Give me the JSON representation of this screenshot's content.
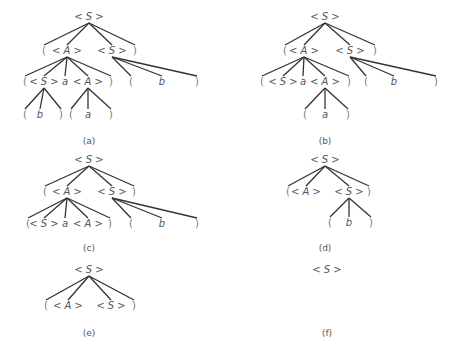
{
  "figure": {
    "type": "parse-tree-sequence",
    "colors": {
      "edge": "#333333",
      "text": "#555555",
      "background": "#ffffff"
    },
    "trees": [
      {
        "label": "(a)",
        "nodes": [
          {
            "id": "r",
            "text": "<S>",
            "x": 89,
            "y": 20
          },
          {
            "id": "l1",
            "text": "(",
            "x": 44,
            "y": 54,
            "parent": "r"
          },
          {
            "id": "A1",
            "text": "<A>",
            "x": 67,
            "y": 54,
            "parent": "r"
          },
          {
            "id": "S1",
            "text": "<S>",
            "x": 112,
            "y": 54,
            "parent": "r"
          },
          {
            "id": "r1",
            "text": ")",
            "x": 135,
            "y": 54,
            "parent": "r"
          },
          {
            "id": "l2",
            "text": "(",
            "x": 25,
            "y": 85,
            "parent": "A1"
          },
          {
            "id": "S2",
            "text": "<S>",
            "x": 44,
            "y": 85,
            "parent": "A1"
          },
          {
            "id": "a2",
            "text": "a",
            "x": 65,
            "y": 85,
            "parent": "A1"
          },
          {
            "id": "A2",
            "text": "<A>",
            "x": 88,
            "y": 85,
            "parent": "A1"
          },
          {
            "id": "r2",
            "text": ")",
            "x": 111,
            "y": 85,
            "parent": "A1"
          },
          {
            "id": "l3",
            "text": "(",
            "x": 131,
            "y": 85,
            "parent": "S1"
          },
          {
            "id": "b3",
            "text": "b",
            "x": 162,
            "y": 85,
            "parent": "S1"
          },
          {
            "id": "r3",
            "text": ")",
            "x": 197,
            "y": 85,
            "parent": "S1"
          },
          {
            "id": "l4",
            "text": "(",
            "x": 25,
            "y": 118,
            "parent": "S2"
          },
          {
            "id": "b4",
            "text": "b",
            "x": 40,
            "y": 118,
            "parent": "S2"
          },
          {
            "id": "r4",
            "text": ")",
            "x": 61,
            "y": 118,
            "parent": "S2"
          },
          {
            "id": "l5",
            "text": "(",
            "x": 71,
            "y": 118,
            "parent": "A2"
          },
          {
            "id": "a5",
            "text": "a",
            "x": 88,
            "y": 118,
            "parent": "A2"
          },
          {
            "id": "r5",
            "text": ")",
            "x": 111,
            "y": 118,
            "parent": "A2"
          }
        ],
        "caption_pos": {
          "x": 89,
          "y": 144
        }
      },
      {
        "label": "(b)",
        "nodes": [
          {
            "id": "r",
            "text": "<S>",
            "x": 325,
            "y": 20
          },
          {
            "id": "l1",
            "text": "(",
            "x": 285,
            "y": 54,
            "parent": "r"
          },
          {
            "id": "A1",
            "text": "<A>",
            "x": 304,
            "y": 54,
            "parent": "r"
          },
          {
            "id": "S1",
            "text": "<S>",
            "x": 350,
            "y": 54,
            "parent": "r"
          },
          {
            "id": "r1",
            "text": ")",
            "x": 375,
            "y": 54,
            "parent": "r"
          },
          {
            "id": "l2",
            "text": "(",
            "x": 262,
            "y": 85,
            "parent": "A1"
          },
          {
            "id": "S2",
            "text": "<S>",
            "x": 283,
            "y": 85,
            "parent": "A1"
          },
          {
            "id": "a2",
            "text": "a",
            "x": 303,
            "y": 85,
            "parent": "A1"
          },
          {
            "id": "A2",
            "text": "<A>",
            "x": 325,
            "y": 85,
            "parent": "A1"
          },
          {
            "id": "r2",
            "text": ")",
            "x": 349,
            "y": 85,
            "parent": "A1"
          },
          {
            "id": "l3",
            "text": "(",
            "x": 366,
            "y": 85,
            "parent": "S1"
          },
          {
            "id": "b3",
            "text": "b",
            "x": 394,
            "y": 85,
            "parent": "S1"
          },
          {
            "id": "r3",
            "text": ")",
            "x": 436,
            "y": 85,
            "parent": "S1"
          },
          {
            "id": "l5",
            "text": "(",
            "x": 305,
            "y": 118,
            "parent": "A2"
          },
          {
            "id": "a5",
            "text": "a",
            "x": 325,
            "y": 118,
            "parent": "A2"
          },
          {
            "id": "r5",
            "text": ")",
            "x": 348,
            "y": 118,
            "parent": "A2"
          }
        ],
        "caption_pos": {
          "x": 325,
          "y": 144
        }
      },
      {
        "label": "(c)",
        "nodes": [
          {
            "id": "r",
            "text": "<S>",
            "x": 89,
            "y": 163
          },
          {
            "id": "l1",
            "text": "(",
            "x": 45,
            "y": 195,
            "parent": "r"
          },
          {
            "id": "A1",
            "text": "<A>",
            "x": 67,
            "y": 195,
            "parent": "r"
          },
          {
            "id": "S1",
            "text": "<S>",
            "x": 112,
            "y": 195,
            "parent": "r"
          },
          {
            "id": "r1",
            "text": ")",
            "x": 134,
            "y": 195,
            "parent": "r"
          },
          {
            "id": "l2",
            "text": "(",
            "x": 28,
            "y": 227,
            "parent": "A1"
          },
          {
            "id": "S2",
            "text": "<S>",
            "x": 44,
            "y": 227,
            "parent": "A1"
          },
          {
            "id": "a2",
            "text": "a",
            "x": 65,
            "y": 227,
            "parent": "A1"
          },
          {
            "id": "A2",
            "text": "<A>",
            "x": 88,
            "y": 227,
            "parent": "A1"
          },
          {
            "id": "r2",
            "text": ")",
            "x": 110,
            "y": 227,
            "parent": "A1"
          },
          {
            "id": "l3",
            "text": "(",
            "x": 131,
            "y": 227,
            "parent": "S1"
          },
          {
            "id": "b3",
            "text": "b",
            "x": 162,
            "y": 227,
            "parent": "S1"
          },
          {
            "id": "r3",
            "text": ")",
            "x": 197,
            "y": 227,
            "parent": "S1"
          }
        ],
        "caption_pos": {
          "x": 89,
          "y": 251
        }
      },
      {
        "label": "(d)",
        "nodes": [
          {
            "id": "r",
            "text": "<S>",
            "x": 325,
            "y": 163
          },
          {
            "id": "l1",
            "text": "(",
            "x": 288,
            "y": 195,
            "parent": "r"
          },
          {
            "id": "A1",
            "text": "<A>",
            "x": 306,
            "y": 195,
            "parent": "r"
          },
          {
            "id": "S1",
            "text": "<S>",
            "x": 349,
            "y": 195,
            "parent": "r"
          },
          {
            "id": "r1",
            "text": ")",
            "x": 369,
            "y": 195,
            "parent": "r"
          },
          {
            "id": "l3",
            "text": "(",
            "x": 330,
            "y": 226,
            "parent": "S1"
          },
          {
            "id": "b3",
            "text": "b",
            "x": 349,
            "y": 226,
            "parent": "S1"
          },
          {
            "id": "r3",
            "text": ")",
            "x": 371,
            "y": 226,
            "parent": "S1"
          }
        ],
        "caption_pos": {
          "x": 325,
          "y": 251
        }
      },
      {
        "label": "(e)",
        "nodes": [
          {
            "id": "r",
            "text": "<S>",
            "x": 89,
            "y": 273
          },
          {
            "id": "l1",
            "text": "(",
            "x": 46,
            "y": 309,
            "parent": "r"
          },
          {
            "id": "A1",
            "text": "<A>",
            "x": 68,
            "y": 309,
            "parent": "r"
          },
          {
            "id": "S1",
            "text": "<S>",
            "x": 111,
            "y": 309,
            "parent": "r"
          },
          {
            "id": "r1",
            "text": ")",
            "x": 134,
            "y": 309,
            "parent": "r"
          }
        ],
        "caption_pos": {
          "x": 89,
          "y": 336
        }
      },
      {
        "label": "(f)",
        "nodes": [
          {
            "id": "r",
            "text": "<S>",
            "x": 327,
            "y": 273
          }
        ],
        "caption_pos": {
          "x": 327,
          "y": 336
        }
      }
    ]
  }
}
